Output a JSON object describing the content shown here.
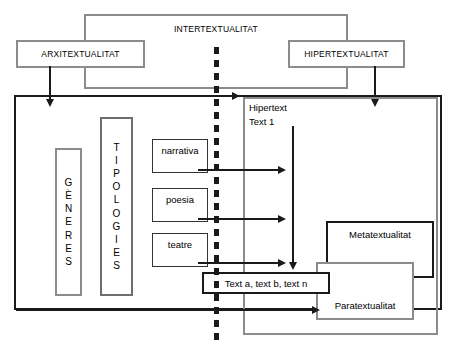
{
  "diagram": {
    "title_top": "INTERTEXTUALITAT",
    "left_top": "ARXITEXTUALITAT",
    "right_top": "HIPERTEXTUALITAT",
    "generes": "GÈNERES",
    "tipologies": "TIPOLOGIES",
    "genre_boxes": [
      {
        "label": "narrativa"
      },
      {
        "label": "poesia"
      },
      {
        "label": "teatre"
      }
    ],
    "hipertext_label": "Hipertext\nText 1",
    "texts_box": "Text a,  text b,  text n",
    "metatextualitat": "Metatextualitat",
    "paratextualitat": "Paratextualitat",
    "generes_letters": [
      "G",
      "È",
      "N",
      "E",
      "R",
      "E",
      "S"
    ],
    "tipologies_letters": [
      "T",
      "I",
      "P",
      "O",
      "L",
      "O",
      "G",
      "I",
      "E",
      "S"
    ],
    "colors": {
      "gray_border": "#8c8c8c",
      "black_border": "#1a1a1a",
      "text": "#000000",
      "background": "#ffffff"
    }
  }
}
